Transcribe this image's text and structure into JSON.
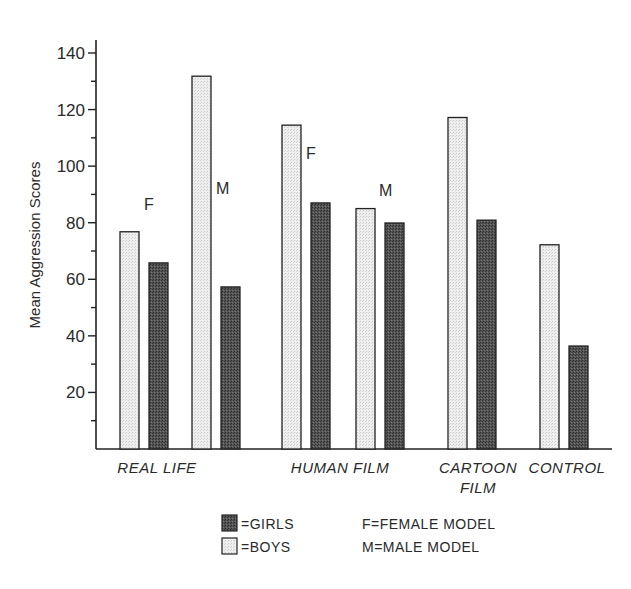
{
  "chart_data": {
    "type": "bar",
    "title": "",
    "xlabel": "",
    "ylabel": "Mean Aggression Scores",
    "ylim": [
      0,
      140
    ],
    "yticks": [
      20,
      40,
      60,
      80,
      100,
      120,
      140
    ],
    "grid": false,
    "groups": [
      {
        "label": [
          "REAL LIFE"
        ],
        "subgroups": [
          {
            "model": "F",
            "boys": 76.8,
            "girls": 65.8
          },
          {
            "model": "M",
            "boys": 131.8,
            "girls": 57.3
          }
        ]
      },
      {
        "label": [
          "HUMAN FILM"
        ],
        "subgroups": [
          {
            "model": "F",
            "boys": 114.5,
            "girls": 87.0
          },
          {
            "model": "M",
            "boys": 85.0,
            "girls": 79.9
          }
        ]
      },
      {
        "label": [
          "CARTOON",
          "FILM"
        ],
        "subgroups": [
          {
            "model": "",
            "boys": 117.2,
            "girls": 80.9
          }
        ]
      },
      {
        "label": [
          "CONTROL"
        ],
        "subgroups": [
          {
            "model": "",
            "boys": 72.2,
            "girls": 36.4
          }
        ]
      }
    ],
    "categories": [
      "REAL LIFE (F)",
      "REAL LIFE (M)",
      "HUMAN FILM (F)",
      "HUMAN FILM (M)",
      "CARTOON FILM",
      "CONTROL"
    ],
    "series": [
      {
        "name": "BOYS",
        "values": [
          76.8,
          131.8,
          114.5,
          85.0,
          117.2,
          72.2
        ]
      },
      {
        "name": "GIRLS",
        "values": [
          65.8,
          57.3,
          87.0,
          79.9,
          80.9,
          36.4
        ]
      }
    ],
    "legend": {
      "position": "bottom",
      "entries": [
        {
          "swatch": "dark",
          "text": "=GIRLS"
        },
        {
          "swatch": "light",
          "text": "=BOYS"
        }
      ],
      "notes": [
        "F=FEMALE MODEL",
        "M=MALE MODEL"
      ]
    }
  },
  "colors": {
    "boys_fill": "#ececec",
    "girls_fill": "#4a4a4a",
    "axis": "#222222"
  }
}
